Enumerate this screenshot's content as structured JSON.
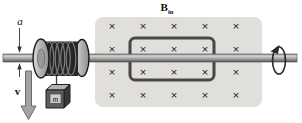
{
  "labels": {
    "a_label": "a",
    "v_label": "v",
    "m_label": "m",
    "b_label_main": "B",
    "b_label_sub": "in"
  },
  "field_region": {
    "symbol": "×",
    "fill": "#e0dfdc",
    "symbol_color": "#8a8a8a",
    "grid_cols": [
      112,
      143,
      174,
      205,
      236
    ],
    "grid_rows": [
      25,
      48,
      71,
      94
    ]
  },
  "colors": {
    "loop_stroke": "#474747",
    "rod_edge": "#4a4a4a",
    "rod_highlight": "#d6d6d6",
    "spool_flange": "#c8c8c8",
    "coil_dark": "#262626",
    "mass_front": "#5e5e5e",
    "velocity_arrow": "#a3a3a3",
    "rotation_stroke": "#2a2a2a"
  }
}
